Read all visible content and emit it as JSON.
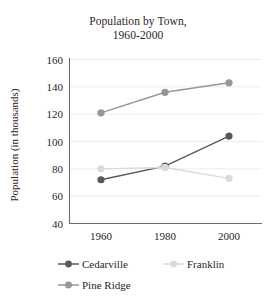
{
  "chart_data": {
    "type": "line",
    "title": "Population by Town, 1960-2000",
    "title_line1": "Population by Town,",
    "title_line2": "1960-2000",
    "xlabel": "",
    "ylabel": "Population (in thousands)",
    "x": [
      1960,
      1980,
      2000
    ],
    "categories": [
      "1960",
      "1980",
      "2000"
    ],
    "xtick_labels": [
      "1960",
      "1980",
      "2000"
    ],
    "ytick_labels": [
      "40",
      "60",
      "80",
      "100",
      "120",
      "140",
      "160"
    ],
    "yticks": [
      40,
      60,
      80,
      100,
      120,
      140,
      160
    ],
    "ylim": [
      40,
      160
    ],
    "grid": true,
    "grid_axis": "y",
    "legend_position": "bottom",
    "series": [
      {
        "name": "Cedarville",
        "color": "#58595b",
        "marker": "circle",
        "values": [
          72,
          82,
          104
        ]
      },
      {
        "name": "Franklin",
        "color": "#d9dadb",
        "marker": "circle",
        "values": [
          80,
          81,
          73
        ]
      },
      {
        "name": "Pine Ridge",
        "color": "#949699",
        "marker": "circle",
        "values": [
          121,
          136,
          143
        ]
      }
    ]
  },
  "legend": {
    "items": [
      {
        "label": "Cedarville",
        "color": "#58595b"
      },
      {
        "label": "Franklin",
        "color": "#d9dadb"
      },
      {
        "label": "Pine Ridge",
        "color": "#949699"
      }
    ]
  }
}
